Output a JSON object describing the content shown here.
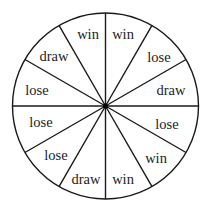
{
  "spinner": {
    "center": {
      "x": 105.5,
      "y": 106
    },
    "radius": 93,
    "stroke_color": "#1a1a1a",
    "hub_color": "#000000",
    "sector_count": 12,
    "sectors": [
      {
        "label": "win",
        "label_x": 123,
        "label_y": 39
      },
      {
        "label": "lose",
        "label_x": 159,
        "label_y": 62
      },
      {
        "label": "draw",
        "label_x": 171,
        "label_y": 95
      },
      {
        "label": "lose",
        "label_x": 167,
        "label_y": 129
      },
      {
        "label": "win",
        "label_x": 156,
        "label_y": 163
      },
      {
        "label": "win",
        "label_x": 123,
        "label_y": 184
      },
      {
        "label": "draw",
        "label_x": 86,
        "label_y": 184
      },
      {
        "label": "lose",
        "label_x": 56,
        "label_y": 160
      },
      {
        "label": "lose",
        "label_x": 41,
        "label_y": 127
      },
      {
        "label": "lose",
        "label_x": 37,
        "label_y": 95
      },
      {
        "label": "draw",
        "label_x": 54,
        "label_y": 61
      },
      {
        "label": "win",
        "label_x": 88,
        "label_y": 39
      }
    ]
  }
}
